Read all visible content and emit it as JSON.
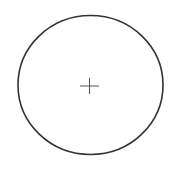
{
  "diagram": {
    "shape": "circle",
    "stroke_color": "#333333",
    "background": "#ffffff",
    "circle": {
      "cx": 90.5,
      "cy": 85,
      "rx": 72.5,
      "ry": 69.5,
      "stroke_width": 1.6
    },
    "center_mark": {
      "icon": "crosshair-icon",
      "x": 89.5,
      "y": 86,
      "half_h": 9.5,
      "half_v": 8
    }
  }
}
